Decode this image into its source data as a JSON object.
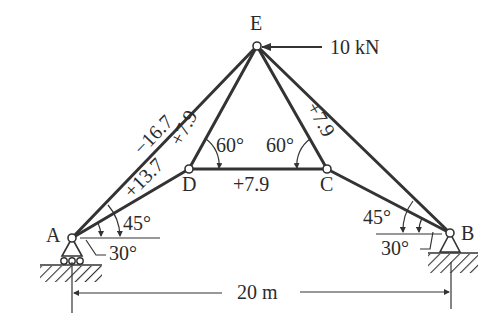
{
  "diagram": {
    "type": "truss",
    "nodes": {
      "A": {
        "label": "A"
      },
      "B": {
        "label": "B"
      },
      "C": {
        "label": "C"
      },
      "D": {
        "label": "D"
      },
      "E": {
        "label": "E"
      }
    },
    "load": {
      "label": "10 kN",
      "node": "E",
      "direction": "left"
    },
    "members": {
      "AE": {
        "force": "−16.7"
      },
      "AD": {
        "force": "+13.7"
      },
      "DE": {
        "force": "+7.9"
      },
      "DC": {
        "force": "+7.9"
      },
      "CE": {
        "force": "+7.9"
      }
    },
    "angles": {
      "D_angle": "60°",
      "C_angle": "60°",
      "A_upper": "45°",
      "A_lower": "30°",
      "B_upper": "45°",
      "B_lower": "30°"
    },
    "span": {
      "label": "20 m"
    }
  }
}
